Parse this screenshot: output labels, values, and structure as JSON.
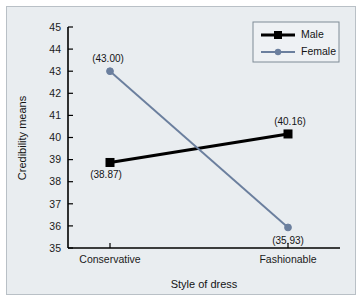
{
  "chart_data": {
    "type": "line",
    "title": "",
    "xlabel": "Style of dress",
    "ylabel": "Credibility means",
    "categories": [
      "Conservative",
      "Fashionable"
    ],
    "ylim": [
      35,
      45
    ],
    "yticks": [
      35,
      36,
      37,
      38,
      39,
      40,
      41,
      42,
      43,
      44,
      45
    ],
    "ytick_labels": [
      "35",
      "36",
      "37",
      "38",
      "39",
      "40",
      "41",
      "42",
      "43",
      "44",
      "45"
    ],
    "grid": false,
    "legend_position": "top-right",
    "series": [
      {
        "name": "Male",
        "color": "#000000",
        "marker": "square",
        "values": [
          38.87,
          40.16
        ],
        "point_labels": [
          "(38.87)",
          "(40.16)"
        ]
      },
      {
        "name": "Female",
        "color": "#6b7f9e",
        "marker": "circle",
        "values": [
          43.0,
          35.93
        ],
        "point_labels": [
          "(43.00)",
          "(35.93)"
        ]
      }
    ]
  },
  "figure": {
    "background_color": "#e9edf0",
    "border_color": "#b9c0c6",
    "axis_color": "#000000"
  }
}
